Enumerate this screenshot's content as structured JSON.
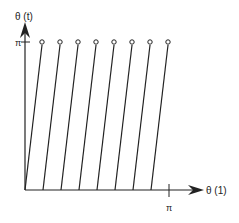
{
  "diagram": {
    "y_axis_label": "θ (t)",
    "x_axis_label": "θ (1)",
    "y_tick_label": "π",
    "x_tick_label": "π",
    "line_color": "#222222",
    "axis_origin": [
      25,
      190
    ],
    "line_count": 8,
    "lines": [
      {
        "bottom_x": 25,
        "top_x": 42
      },
      {
        "bottom_x": 43,
        "top_x": 60
      },
      {
        "bottom_x": 61,
        "top_x": 78
      },
      {
        "bottom_x": 79,
        "top_x": 96
      },
      {
        "bottom_x": 97,
        "top_x": 114
      },
      {
        "bottom_x": 115,
        "top_x": 132
      },
      {
        "bottom_x": 133,
        "top_x": 150
      },
      {
        "bottom_x": 151,
        "top_x": 168
      }
    ],
    "endpoint_marker": "open-circle"
  }
}
